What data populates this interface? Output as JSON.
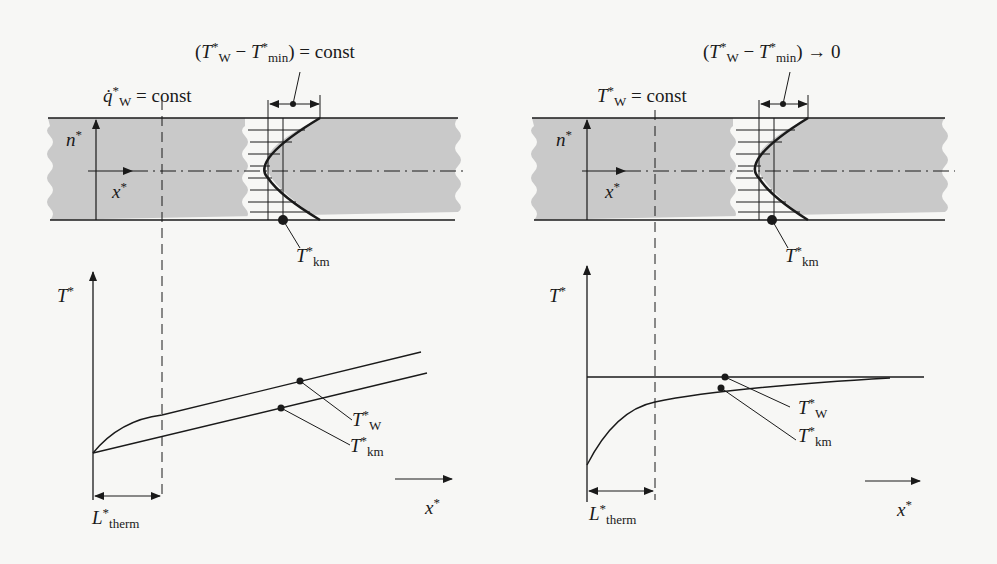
{
  "figure": {
    "left_panel": {
      "title_expr": "(T*W − T*min) = const",
      "title_parts": {
        "open": "(",
        "T": "T",
        "sup": "*",
        "sub_w": "W",
        "minus": " − ",
        "sub_min": "min",
        "close": ") = const"
      },
      "boundary_condition": {
        "symbol": "q̇",
        "sup": "*",
        "sub": "W",
        "rest": " = const"
      },
      "axis_n": {
        "sym": "n",
        "sup": "*"
      },
      "axis_x": {
        "sym": "x",
        "sup": "*"
      },
      "profile_point_label": {
        "sym": "T",
        "sup": "*",
        "sub": "km"
      },
      "graph": {
        "y_label": {
          "sym": "T",
          "sup": "*"
        },
        "x_label": {
          "sym": "x",
          "sup": "*"
        },
        "length_label": {
          "sym": "L",
          "sup": "*",
          "sub": "therm"
        },
        "curve_labels": [
          {
            "sym": "T",
            "sup": "*",
            "sub": "W"
          },
          {
            "sym": "T",
            "sup": "*",
            "sub": "km"
          }
        ]
      }
    },
    "right_panel": {
      "title_parts": {
        "open": "(",
        "T": "T",
        "sup": "*",
        "sub_w": "W",
        "minus": " − ",
        "sub_min": "min",
        "close": ") → 0"
      },
      "boundary_condition": {
        "symbol": "T",
        "sup": "*",
        "sub": "W",
        "rest": " = const"
      },
      "axis_n": {
        "sym": "n",
        "sup": "*"
      },
      "axis_x": {
        "sym": "x",
        "sup": "*"
      },
      "profile_point_label": {
        "sym": "T",
        "sup": "*",
        "sub": "km"
      },
      "graph": {
        "y_label": {
          "sym": "T",
          "sup": "*"
        },
        "x_label": {
          "sym": "x",
          "sup": "*"
        },
        "length_label": {
          "sym": "L",
          "sup": "*",
          "sub": "therm"
        },
        "curve_labels": [
          {
            "sym": "T",
            "sup": "*",
            "sub": "W"
          },
          {
            "sym": "T",
            "sup": "*",
            "sub": "km"
          }
        ]
      }
    },
    "colors": {
      "channel_fill": "#c9c9c9",
      "ink": "#1a1a1a",
      "paper": "#f7f7f5"
    }
  }
}
